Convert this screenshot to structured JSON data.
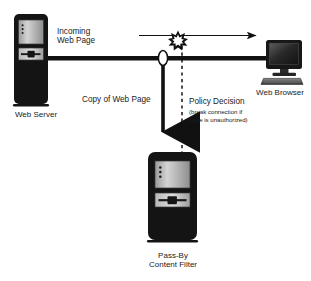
{
  "diagram": {
    "background": "#ffffff",
    "ink": "#111111",
    "nodes": [
      {
        "id": "web-server",
        "label": "Web Server",
        "type": "tower-computer-icon",
        "x": 14,
        "y": 14,
        "w": 34,
        "h": 90
      },
      {
        "id": "web-browser",
        "label": "Web Browser",
        "type": "desktop-monitor-icon",
        "x": 262,
        "y": 40,
        "w": 42,
        "h": 42
      },
      {
        "id": "content-filter",
        "label_line1": "Pass-By",
        "label_line2": "Content Filter",
        "type": "tower-computer-icon",
        "x": 148,
        "y": 152,
        "w": 49,
        "h": 88
      }
    ],
    "connections": [
      {
        "id": "incoming-web-page",
        "label_line1": "Incoming",
        "label_line2": "Web Page",
        "style": "thin-arrow",
        "from": "web-server",
        "to": "web-browser"
      },
      {
        "id": "copy-of-web-page",
        "label": "Copy of Web Page",
        "style": "thick-arrow-down",
        "from": "tap-junction",
        "to": "content-filter"
      },
      {
        "id": "policy-decision",
        "label": "Policy Decision",
        "sub_line1": "(break connection if",
        "sub_line2": "page is unauthorized)",
        "style": "dashed-line",
        "from": "content-filter",
        "to": "break-point"
      }
    ],
    "markers": [
      {
        "id": "break-point",
        "type": "starburst-icon",
        "x": 178,
        "y": 40
      },
      {
        "id": "tap-junction",
        "type": "ellipse-node-icon",
        "x": 163,
        "y": 58
      }
    ]
  }
}
